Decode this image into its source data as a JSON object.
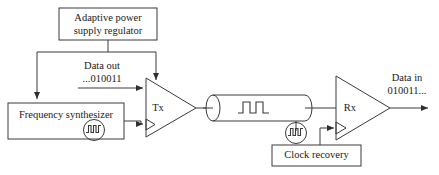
{
  "diagram": {
    "type": "block-diagram",
    "colors": {
      "stroke": "#3a3a3a",
      "text": "#1a1a1a",
      "background": "#ffffff"
    },
    "blocks": [
      {
        "id": "regulator",
        "label": "Adaptive power\nsupply regulator",
        "shape": "rectangle"
      },
      {
        "id": "frequency-synthesizer",
        "label": "Frequency synthesizer",
        "shape": "rectangle",
        "icon": "clock-waveform-icon"
      },
      {
        "id": "tx",
        "label": "Tx",
        "shape": "triangle-amplifier",
        "clock_input": true
      },
      {
        "id": "channel",
        "label": "",
        "shape": "cylinder-cable",
        "icon": "square-wave-icon"
      },
      {
        "id": "rx",
        "label": "Rx",
        "shape": "triangle-amplifier",
        "clock_input": true
      },
      {
        "id": "clock-recovery",
        "label": "Clock recovery",
        "shape": "rectangle",
        "icon": "clock-waveform-icon"
      }
    ],
    "signals": [
      {
        "id": "data-out",
        "label": "Data out\n...010011",
        "from": "input",
        "to": "tx"
      },
      {
        "id": "data-in",
        "label": "Data in\n010011...",
        "from": "rx",
        "to": "output"
      }
    ],
    "labels": {
      "regulator": "Adaptive power",
      "regulator_line2": "supply regulator",
      "frequency_synthesizer": "Frequency synthesizer",
      "tx": "Tx",
      "rx": "Rx",
      "clock_recovery": "Clock recovery",
      "data_out_line1": "Data out",
      "data_out_line2": "...010011",
      "data_in_line1": "Data in",
      "data_in_line2": "010011..."
    }
  }
}
